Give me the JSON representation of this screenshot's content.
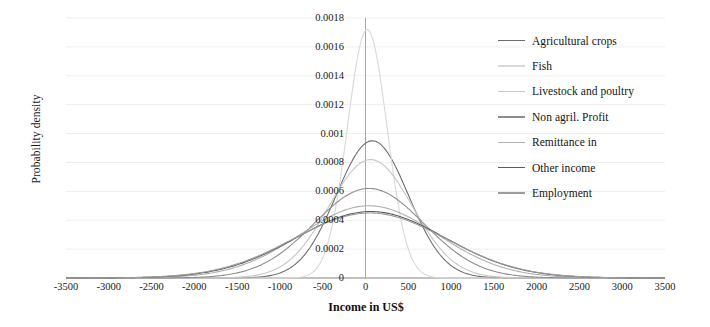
{
  "chart_data": {
    "type": "line",
    "title": "",
    "xlabel": "Income in US$",
    "ylabel": "Probability density",
    "xlim": [
      -3500,
      3500
    ],
    "ylim": [
      0,
      0.0018
    ],
    "xticks": [
      "-3500",
      "-3000",
      "-2500",
      "-2000",
      "-1500",
      "-1000",
      "-500",
      "0",
      "500",
      "1000",
      "1500",
      "2000",
      "2500",
      "3000",
      "3500"
    ],
    "xtick_values": [
      -3500,
      -3000,
      -2500,
      -2000,
      -1500,
      -1000,
      -500,
      0,
      500,
      1000,
      1500,
      2000,
      2500,
      3000,
      3500
    ],
    "yticks": [
      "0",
      "0.0002",
      "0.0004",
      "0.0006",
      "0.0008",
      "0.001",
      "0.0012",
      "0.0014",
      "0.0016",
      "0.0018"
    ],
    "ytick_values": [
      0,
      0.0002,
      0.0004,
      0.0006,
      0.0008,
      0.001,
      0.0012,
      0.0014,
      0.0016,
      0.0018
    ],
    "grid": true,
    "grid_axis": "y",
    "legend_position": "right",
    "distribution": "normal",
    "series": [
      {
        "name": "Agricultural crops",
        "color": "#6e6e6e",
        "mean": 80,
        "sd": 420,
        "peak": 0.00095,
        "linewidth": 1.1
      },
      {
        "name": "Fish",
        "color": "#d9d9d9",
        "mean": 20,
        "sd": 232,
        "peak": 0.00172,
        "linewidth": 1.1
      },
      {
        "name": "Livestock and poultry",
        "color": "#c6c6c6",
        "mean": 60,
        "sd": 487,
        "peak": 0.00082,
        "linewidth": 1.1
      },
      {
        "name": "Non agril. Profit",
        "color": "#8f8f8f",
        "mean": 40,
        "sd": 643,
        "peak": 0.00062,
        "linewidth": 1.1
      },
      {
        "name": "Remittance in",
        "color": "#b0b0b0",
        "mean": 40,
        "sd": 798,
        "peak": 0.0005,
        "linewidth": 1.1
      },
      {
        "name": "Other income",
        "color": "#5d5d5d",
        "mean": 60,
        "sd": 868,
        "peak": 0.00046,
        "linewidth": 1.1
      },
      {
        "name": "Employment",
        "color": "#9c9c9c",
        "mean": 50,
        "sd": 887,
        "peak": 0.00045,
        "linewidth": 1.1
      }
    ]
  },
  "colors": {
    "axis": "#8a8a8a",
    "grid": "#efefef",
    "text": "#1a1a1a",
    "background": "#ffffff"
  }
}
